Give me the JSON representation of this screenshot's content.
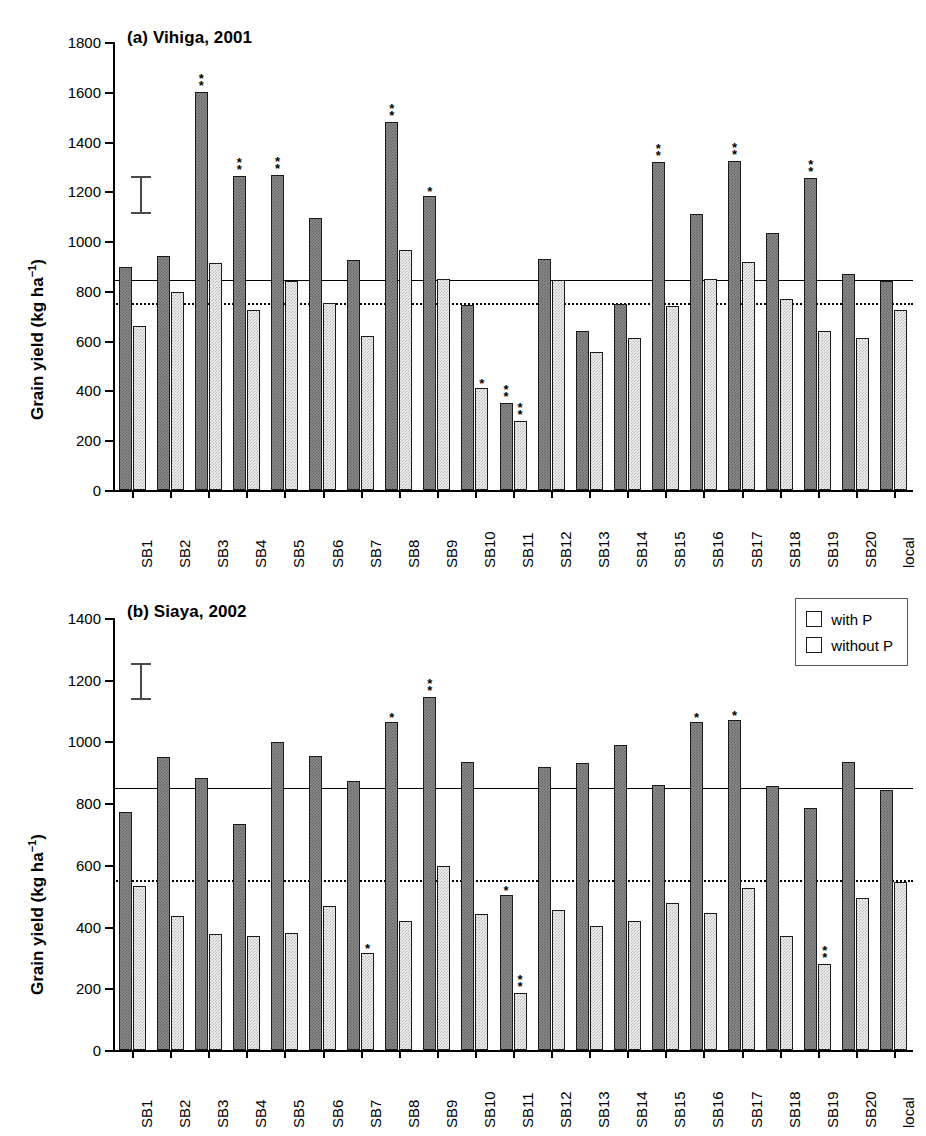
{
  "figure": {
    "ylabel": "Grain yield (kg ha",
    "ylabel_sup": "−1",
    "ylabel_close": ")",
    "legend": {
      "with_p": "with P",
      "without_p": "without P"
    },
    "colors": {
      "with_p": "#8a8a8a",
      "without_p": "#f2f2f2",
      "outline": "#1a1a1a",
      "axis": "#000000"
    }
  },
  "chart_data": [
    {
      "type": "bar",
      "id": "panel-a",
      "title": "(a) Vihiga, 2001",
      "xlabel": "",
      "ylabel": "Grain yield (kg ha−1)",
      "ylim": [
        0,
        1800
      ],
      "yticks": [
        0,
        200,
        400,
        600,
        800,
        1000,
        1200,
        1400,
        1600,
        1800
      ],
      "grid": false,
      "legend_position": "none",
      "categories": [
        "SB1",
        "SB2",
        "SB3",
        "SB4",
        "SB5",
        "SB6",
        "SB7",
        "SB8",
        "SB9",
        "SB10",
        "SB11",
        "SB12",
        "SB13",
        "SB14",
        "SB15",
        "SB16",
        "SB17",
        "SB18",
        "SB19",
        "SB20",
        "local"
      ],
      "series": [
        {
          "name": "with P",
          "values": [
            895,
            940,
            1598,
            1262,
            1265,
            1093,
            925,
            1480,
            1182,
            742,
            348,
            928,
            638,
            748,
            1318,
            1108,
            1320,
            1032,
            1253,
            868,
            838
          ]
        },
        {
          "name": "without P",
          "values": [
            658,
            795,
            912,
            725,
            840,
            752,
            620,
            965,
            848,
            410,
            278,
            845,
            555,
            610,
            740,
            848,
            918,
            768,
            640,
            610,
            722
          ]
        }
      ],
      "annotations": {
        "with P": {
          "SB3": "**",
          "SB4": "**",
          "SB5": "**",
          "SB8": "**",
          "SB9": "*",
          "SB11": "**",
          "SB15": "**",
          "SB17": "**",
          "SB19": "**"
        },
        "without P": {
          "SB10": "*",
          "SB11": "**"
        }
      },
      "reference_lines": [
        {
          "style": "solid",
          "value": 845
        },
        {
          "style": "dotted",
          "value": 750
        }
      ],
      "lsd_bar": {
        "center": 1185,
        "half_range": 75
      }
    },
    {
      "type": "bar",
      "id": "panel-b",
      "title": "(b) Siaya, 2002",
      "xlabel": "",
      "ylabel": "Grain yield (kg ha−1)",
      "ylim": [
        0,
        1400
      ],
      "yticks": [
        0,
        200,
        400,
        600,
        800,
        1000,
        1200,
        1400
      ],
      "grid": false,
      "legend_position": "upper right",
      "categories": [
        "SB1",
        "SB2",
        "SB3",
        "SB4",
        "SB5",
        "SB6",
        "SB7",
        "SB8",
        "SB9",
        "SB10",
        "SB11",
        "SB12",
        "SB13",
        "SB14",
        "SB15",
        "SB16",
        "SB17",
        "SB18",
        "SB19",
        "SB20",
        "local"
      ],
      "series": [
        {
          "name": "with P",
          "values": [
            770,
            948,
            880,
            733,
            998,
            953,
            872,
            1062,
            1145,
            932,
            503,
            918,
            930,
            988,
            860,
            1062,
            1068,
            855,
            785,
            935,
            843
          ]
        },
        {
          "name": "without P",
          "values": [
            533,
            435,
            375,
            368,
            380,
            467,
            315,
            418,
            595,
            440,
            185,
            453,
            403,
            418,
            478,
            443,
            525,
            368,
            278,
            492,
            545
          ]
        }
      ],
      "annotations": {
        "with P": {
          "SB8": "*",
          "SB9": "**",
          "SB11": "*",
          "SB16": "*",
          "SB17": "*"
        },
        "without P": {
          "SB7": "*",
          "SB11": "**",
          "SB19": "**"
        }
      },
      "reference_lines": [
        {
          "style": "solid",
          "value": 850
        },
        {
          "style": "dotted",
          "value": 550
        }
      ],
      "lsd_bar": {
        "center": 1195,
        "half_range": 60
      }
    }
  ]
}
